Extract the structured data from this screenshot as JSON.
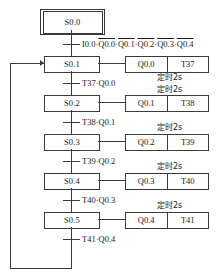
{
  "diagram": {
    "type": "sequential-function-chart",
    "initial_step": {
      "label": "S0.0"
    },
    "loop_back_target": "S0.1",
    "first_transition": {
      "id": "t0",
      "terms": [
        {
          "text": "I0.0",
          "overline": false
        },
        {
          "text": "Q0.0",
          "overline": true
        },
        {
          "text": "Q0.1",
          "overline": true
        },
        {
          "text": "Q0.2",
          "overline": true
        },
        {
          "text": "Q0.3",
          "overline": true
        },
        {
          "text": "Q0.4",
          "overline": true
        }
      ],
      "separator": "·"
    },
    "steps": [
      {
        "label": "S0.1",
        "output": "Q0.0",
        "timer": "T37",
        "note": "定时2s",
        "transition": "T37·Q0.0"
      },
      {
        "label": "S0.2",
        "output": "Q0.1",
        "timer": "T38",
        "note": "定时2s",
        "transition": "T38·Q0.1"
      },
      {
        "label": "S0.3",
        "output": "Q0.2",
        "timer": "T39",
        "note": "定时2s",
        "transition": "T39·Q0.2"
      },
      {
        "label": "S0.4",
        "output": "Q0.3",
        "timer": "T40",
        "note": "定时2s",
        "transition": "T40·Q0.3"
      },
      {
        "label": "S0.5",
        "output": "Q0.4",
        "timer": "T41",
        "note": "定时2s",
        "transition": "T41·Q0.4"
      }
    ],
    "colors": {
      "line": "#3a3a3a",
      "text": "#1a1a1a",
      "background": "#ffffff"
    }
  }
}
